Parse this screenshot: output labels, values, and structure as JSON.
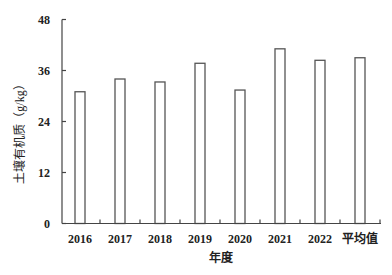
{
  "chart_data": {
    "type": "bar",
    "title": "",
    "xlabel": "年度",
    "ylabel": "土壤有机质（g/kg）",
    "categories": [
      "2016",
      "2017",
      "2018",
      "2019",
      "2020",
      "2021",
      "2022",
      "平均值"
    ],
    "values": [
      31.0,
      34.0,
      33.3,
      37.7,
      31.4,
      41.1,
      38.4,
      39.0
    ],
    "ylim": [
      0,
      48
    ],
    "yticks": [
      0,
      12,
      24,
      36,
      48
    ],
    "grid": false,
    "legend": null,
    "bar_style": {
      "fill": "#ffffff",
      "stroke": "#555555"
    }
  }
}
